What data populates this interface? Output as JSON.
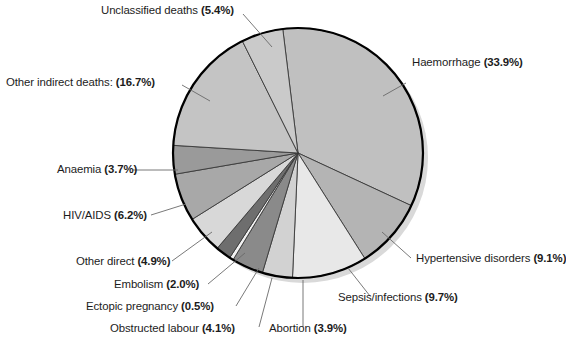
{
  "chart_data": {
    "type": "pie",
    "title": "",
    "subtitle": "",
    "xlabel": "",
    "ylabel": "",
    "legend_position": "none",
    "grid": false,
    "units": "percent",
    "start_angle_deg": -7,
    "direction": "clockwise",
    "categories": [
      "Haemorrhage",
      "Hypertensive disorders",
      "Sepsis/infections",
      "Abortion",
      "Obstructed labour",
      "Ectopic pregnancy",
      "Embolism",
      "Other direct",
      "HIV/AIDS",
      "Anaemia",
      "Other indirect deaths:",
      "Unclassified deaths"
    ],
    "values": [
      33.9,
      9.1,
      9.7,
      3.9,
      4.1,
      0.5,
      2.0,
      4.9,
      6.2,
      3.7,
      16.7,
      5.4
    ],
    "slices": [
      {
        "name": "Haemorrhage",
        "label": "Haemorrhage",
        "pct": "(33.9%)",
        "value": 33.9,
        "color": "#c0c0c0"
      },
      {
        "name": "Hypertensive disorders",
        "label": "Hypertensive disorders",
        "pct": "(9.1%)",
        "value": 9.1,
        "color": "#b4b4b4"
      },
      {
        "name": "Sepsis/infections",
        "label": "Sepsis/infections",
        "pct": "(9.7%)",
        "value": 9.7,
        "color": "#e8e8e8"
      },
      {
        "name": "Abortion",
        "label": "Abortion",
        "pct": "(3.9%)",
        "value": 3.9,
        "color": "#d2d2d2"
      },
      {
        "name": "Obstructed labour",
        "label": "Obstructed labour",
        "pct": "(4.1%)",
        "value": 4.1,
        "color": "#8a8a8a"
      },
      {
        "name": "Ectopic pregnancy",
        "label": "Ectopic pregnancy",
        "pct": "(0.5%)",
        "value": 0.5,
        "color": "#f2f2f2"
      },
      {
        "name": "Embolism",
        "label": "Embolism",
        "pct": "(2.0%)",
        "value": 2.0,
        "color": "#6e6e6e"
      },
      {
        "name": "Other direct",
        "label": "Other direct",
        "pct": "(4.9%)",
        "value": 4.9,
        "color": "#d8d8d8"
      },
      {
        "name": "HIV/AIDS",
        "label": "HIV/AIDS",
        "pct": "(6.2%)",
        "value": 6.2,
        "color": "#a8a8a8"
      },
      {
        "name": "Anaemia",
        "label": "Anaemia",
        "pct": "(3.7%)",
        "value": 3.7,
        "color": "#9a9a9a"
      },
      {
        "name": "Other indirect deaths",
        "label": "Other indirect deaths:",
        "pct": "(16.7%)",
        "value": 16.7,
        "color": "#c4c4c4"
      },
      {
        "name": "Unclassified deaths",
        "label": "Unclassified deaths",
        "pct": "(5.4%)",
        "value": 5.4,
        "color": "#cacaca"
      }
    ]
  },
  "labels": {
    "unclassified_deaths": {
      "text": "Unclassified deaths",
      "pct": "(5.4%)"
    },
    "other_indirect_deaths": {
      "text": "Other indirect deaths:",
      "pct": "(16.7%)"
    },
    "anaemia": {
      "text": "Anaemia",
      "pct": "(3.7%)"
    },
    "hiv_aids": {
      "text": "HIV/AIDS",
      "pct": "(6.2%)"
    },
    "other_direct": {
      "text": "Other direct",
      "pct": "(4.9%)"
    },
    "embolism": {
      "text": "Embolism",
      "pct": "(2.0%)"
    },
    "ectopic_pregnancy": {
      "text": "Ectopic pregnancy",
      "pct": "(0.5%)"
    },
    "obstructed_labour": {
      "text": "Obstructed labour",
      "pct": "(4.1%)"
    },
    "abortion": {
      "text": "Abortion",
      "pct": "(3.9%)"
    },
    "sepsis_infections": {
      "text": "Sepsis/infections",
      "pct": "(9.7%)"
    },
    "hypertensive_disorders": {
      "text": "Hypertensive disorders",
      "pct": "(9.1%)"
    },
    "haemorrhage": {
      "text": "Haemorrhage",
      "pct": "(33.9%)"
    }
  },
  "style": {
    "background": "#ffffff",
    "outline": "#000000",
    "shadow": "#d9d9d9",
    "leader_line": "#6a6a6a",
    "text": "#1c1c1c"
  }
}
